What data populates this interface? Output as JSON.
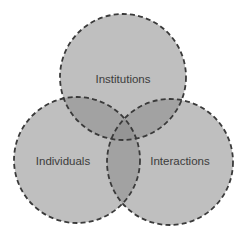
{
  "diagram": {
    "type": "venn",
    "sets": [
      {
        "id": "institutions",
        "label": "Institutions",
        "cx": 123,
        "cy": 77,
        "r": 63,
        "label_x": 123,
        "label_y": 80
      },
      {
        "id": "individuals",
        "label": "Individuals",
        "cx": 77,
        "cy": 160,
        "r": 63,
        "label_x": 63,
        "label_y": 162
      },
      {
        "id": "interactions",
        "label": "Interactions",
        "cx": 170,
        "cy": 162,
        "r": 63,
        "label_x": 180,
        "label_y": 162
      }
    ],
    "colors": {
      "background": "#ffffff",
      "fill": "#8a8a8a",
      "stroke": "#3a3a3a",
      "text": "#3c3c3c"
    }
  }
}
